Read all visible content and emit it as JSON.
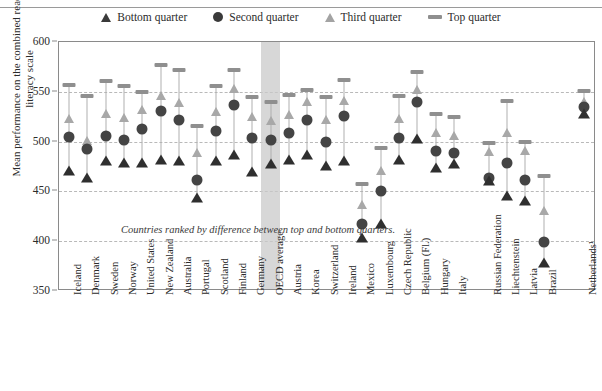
{
  "legend": {
    "items": [
      {
        "label": "Bottom quarter",
        "icon": "triangle-dark-icon",
        "color": "#2f2f2f"
      },
      {
        "label": "Second quarter",
        "icon": "circle-dark-icon",
        "color": "#3a3a3a"
      },
      {
        "label": "Third quarter",
        "icon": "triangle-light-icon",
        "color": "#a8a8a8"
      },
      {
        "label": "Top quarter",
        "icon": "bar-gray-icon",
        "color": "#8f8f8f"
      }
    ]
  },
  "axis": {
    "y_title": "Mean performance on the combined reading literacy scale",
    "y_ticks": [
      "600",
      "550",
      "500",
      "450",
      "400",
      "350"
    ]
  },
  "annotation": "Countries ranked by difference between top and bottom quarters.",
  "chart_data": {
    "type": "scatter",
    "title": "",
    "subtitle": "",
    "xlabel": "",
    "ylabel": "Mean performance on the combined reading literacy scale",
    "ylim": [
      350,
      600
    ],
    "ytick_values": [
      350,
      400,
      450,
      500,
      550,
      600
    ],
    "grid": true,
    "grid_lines_at": [
      400,
      450,
      500,
      550
    ],
    "legend_position": "top-center",
    "highlight_category": "OECD average",
    "note": "Countries ranked by difference between top and bottom quarters.",
    "categories": [
      "Iceland",
      "Denmark",
      "Sweden",
      "Norway",
      "United States",
      "New Zealand",
      "Australia",
      "Portugal",
      "Scotland",
      "Finland",
      "Germany",
      "OECD average",
      "Austria",
      "Korea",
      "Switzerland",
      "Ireland",
      "Mexico",
      "Luxembourg",
      "Czech Republic",
      "Belgium (Fl.)",
      "Hungary",
      "Italy",
      "Russian Federation",
      "Liechtenstein",
      "Latvia",
      "Brazil",
      "Netherlands¹"
    ],
    "series": [
      {
        "name": "Bottom quarter",
        "marker": "triangle-dark",
        "color": "#2f2f2f",
        "values": [
          470,
          463,
          481,
          479,
          479,
          482,
          481,
          443,
          481,
          487,
          469,
          478,
          482,
          487,
          476,
          481,
          403,
          417,
          482,
          503,
          473,
          478,
          460,
          445,
          440,
          378,
          528
        ]
      },
      {
        "name": "Second quarter",
        "marker": "circle-dark",
        "color": "#3a3a3a",
        "values": [
          505,
          493,
          506,
          502,
          513,
          531,
          522,
          461,
          511,
          537,
          504,
          502,
          509,
          522,
          500,
          526,
          417,
          450,
          504,
          540,
          491,
          489,
          463,
          479,
          461,
          399,
          535
        ]
      },
      {
        "name": "Third quarter",
        "marker": "triangle-light",
        "color": "#a8a8a8",
        "values": [
          523,
          501,
          528,
          524,
          532,
          546,
          539,
          489,
          530,
          553,
          525,
          521,
          527,
          540,
          522,
          541,
          436,
          470,
          523,
          552,
          509,
          506,
          490,
          509,
          491,
          430,
          540
        ]
      },
      {
        "name": "Top quarter",
        "marker": "bar-gray",
        "color": "#8f8f8f",
        "values": [
          557,
          546,
          561,
          556,
          550,
          577,
          572,
          516,
          556,
          572,
          545,
          540,
          547,
          552,
          545,
          562,
          457,
          494,
          546,
          570,
          528,
          525,
          499,
          541,
          500,
          465,
          551
        ]
      }
    ]
  }
}
